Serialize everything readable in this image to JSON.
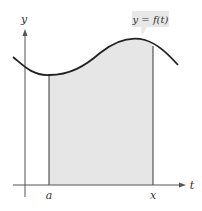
{
  "diagram": {
    "type": "area-under-curve",
    "curve_label": "y = f(t)",
    "axes": {
      "horizontal_label": "t",
      "vertical_label": "y"
    },
    "bounds": {
      "lower_label": "a",
      "upper_label": "x"
    },
    "colors": {
      "shaded_region": "#e6e6e6",
      "curve": "#222222",
      "axes": "#555555",
      "callout_bg": "#e8e8e8"
    }
  }
}
